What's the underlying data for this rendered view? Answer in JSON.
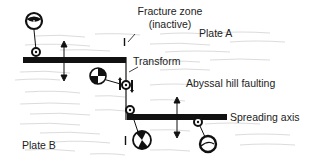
{
  "diagram": {
    "labels": {
      "fracture_zone": "Fracture zone",
      "fracture_zone_sub": "(inactive)",
      "plate_a": "Plate A",
      "plate_b": "Plate B",
      "transform": "Transform",
      "abyssal_hill_faulting": "Abyssal hill faulting",
      "spreading_axis": "Spreading axis"
    },
    "elements": {
      "ridge_segments": [
        "upper-left ridge segment",
        "lower-right ridge segment"
      ],
      "focal_mechanisms": [
        "normal-fault beach ball (upper left)",
        "strike-slip beach ball (transform)",
        "strike-slip beach ball (lower center)",
        "normal-fault beach ball (lower right)"
      ],
      "arrows": [
        "spreading direction arrow left",
        "spreading direction arrow right"
      ]
    },
    "colors": {
      "ink": "#111111",
      "texture": "#cfcfcf",
      "background": "#ffffff"
    }
  }
}
